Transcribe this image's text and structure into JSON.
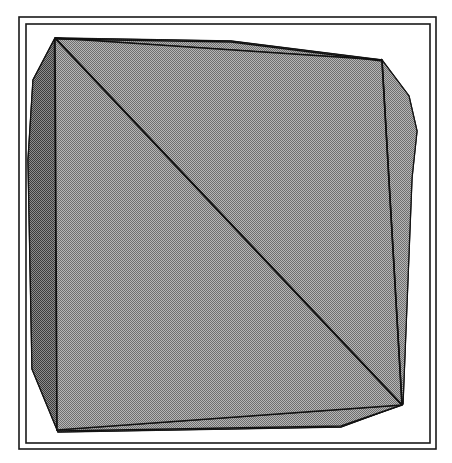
{
  "figure": {
    "background_color": "#ffffff",
    "fill_color": "#949494",
    "fill_pattern": "dither-50-checkerboard",
    "edge_color": "#111111",
    "frame_color": "#1a1a1a",
    "shadow_color": "#4a4a4a",
    "canvas": {
      "width": 452,
      "height": 463
    }
  },
  "frame": {
    "outer": {
      "x": 19,
      "y": 17,
      "width": 417,
      "height": 432,
      "stroke_width": 1.6
    },
    "inner": {
      "x": 26,
      "y": 24,
      "width": 404,
      "height": 419,
      "stroke_width": 1.6
    }
  },
  "geometry": {
    "silhouette_label": "outer-silhouette",
    "silhouette": [
      [
        55,
        38
      ],
      [
        231,
        41
      ],
      [
        382,
        60
      ],
      [
        409,
        96
      ],
      [
        417,
        131
      ],
      [
        412,
        178
      ],
      [
        403,
        404
      ],
      [
        341,
        427
      ],
      [
        58,
        432
      ],
      [
        32,
        369
      ],
      [
        28,
        160
      ],
      [
        33,
        80
      ]
    ],
    "front_face_label": "front-quadrilateral-face",
    "front_face": [
      [
        55,
        38
      ],
      [
        382,
        60
      ],
      [
        402,
        405
      ],
      [
        57,
        430
      ]
    ],
    "top_facet_label": "top-bevel-facet",
    "top_facet": [
      [
        55,
        38
      ],
      [
        231,
        41
      ],
      [
        382,
        60
      ]
    ],
    "right_facet_label": "right-bevel-facet",
    "right_facet": [
      [
        382,
        60
      ],
      [
        409,
        96
      ],
      [
        417,
        131
      ],
      [
        412,
        178
      ],
      [
        403,
        404
      ],
      [
        402,
        405
      ]
    ],
    "bottom_facet_label": "bottom-bevel-facet",
    "bottom_facet": [
      [
        57,
        430
      ],
      [
        402,
        405
      ],
      [
        341,
        427
      ],
      [
        58,
        432
      ]
    ],
    "left_facet_label": "left-bevel-facet",
    "left_facet": [
      [
        55,
        38
      ],
      [
        33,
        80
      ],
      [
        28,
        160
      ],
      [
        32,
        369
      ],
      [
        58,
        432
      ],
      [
        57,
        430
      ]
    ],
    "diagonal_label": "main-interior-diagonal",
    "diagonal": [
      [
        55,
        38
      ],
      [
        402,
        405
      ]
    ],
    "interior_vertical_label": "interior-vertical-crease",
    "interior_vertical": [
      [
        54,
        40
      ],
      [
        57,
        428
      ]
    ],
    "interior_right_crease_label": "interior-right-crease",
    "interior_right_crease": [
      [
        382,
        61
      ],
      [
        402,
        404
      ]
    ],
    "interior_top_crease_label": "interior-top-crease",
    "interior_top_crease": [
      [
        55,
        39
      ],
      [
        231,
        42
      ],
      [
        382,
        61
      ]
    ],
    "interior_bottom_crease_label": "interior-bottom-crease",
    "interior_bottom_crease": [
      [
        58,
        431
      ],
      [
        341,
        426
      ],
      [
        402,
        405
      ]
    ],
    "vertex_count": 12,
    "edge_count": 16,
    "face_count": 5
  }
}
